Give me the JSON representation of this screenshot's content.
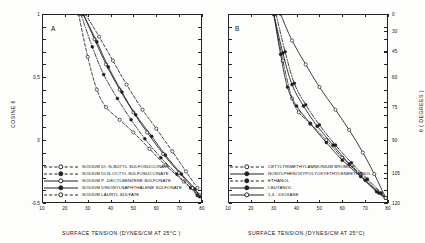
{
  "figure": {
    "panels": [
      {
        "letter": "A",
        "xlabel": "SURFACE TENSION (DYNES/CM AT 25°C )",
        "ylabel": "COSINE  θ",
        "xticks": [
          "10",
          "20",
          "30",
          "40",
          "50",
          "60",
          "70",
          "80"
        ],
        "yticks": [
          "1.0",
          "0.5",
          "0",
          "-0.5"
        ],
        "legend": [
          {
            "label": "SODIUM DI -N-BUTYL SULFOSUCCINATE",
            "style": "dash",
            "marker": "open-circle"
          },
          {
            "label": "SODIUM DI-N-OCTYL SULFOSUCCINATE",
            "style": "dashdot",
            "marker": "filled-circle"
          },
          {
            "label": "SODIUM P -DECYLBENZENE  SULFONATE",
            "style": "solid",
            "marker": "open-circle"
          },
          {
            "label": "SODIUM DINONYLNAPHTHALENE  SULFONATE",
            "style": "solid",
            "marker": "filled-circle"
          },
          {
            "label": "SODIUM LAURYL  SULFATE",
            "style": "dash",
            "marker": "open-circle"
          }
        ]
      },
      {
        "letter": "B",
        "xlabel": "SURFACE TENSION (DYNES/CM AT 25°C)",
        "ylabel": "θ  ( DEGREES )",
        "xticks": [
          "10",
          "20",
          "30",
          "40",
          "50",
          "60",
          "70",
          "80"
        ],
        "yticks": [
          "0",
          "30",
          "45",
          "60",
          "75",
          "90",
          "105",
          "120"
        ],
        "legend": [
          {
            "label": "CETYLTRIMETHYLAMMONIUM BROMIDE",
            "style": "dashdot",
            "marker": "open-circle"
          },
          {
            "label": "NONYLPHENOXYPOLYOXYETHYLENEETHANOL",
            "style": "solid",
            "marker": "filled-circle"
          },
          {
            "label": "ETHANOL",
            "style": "dashdot",
            "marker": "filled-circle"
          },
          {
            "label": "I-BUTANOL",
            "style": "solid",
            "marker": "filled-circle"
          },
          {
            "label": "1,4 - DIOXANE",
            "style": "solid",
            "marker": "open-circle"
          }
        ]
      }
    ]
  },
  "chart_data": {
    "type": "line",
    "title": "",
    "xlabel": "SURFACE TENSION (DYNES/CM AT 25°C)",
    "ylabel_left": "COSINE θ",
    "ylabel_right": "θ (DEGREES)",
    "xlim": [
      10,
      80
    ],
    "ylim_left": [
      -0.5,
      1.0
    ],
    "ylim_right": [
      0,
      120
    ],
    "xticks": [
      10,
      20,
      30,
      40,
      50,
      60,
      70,
      80
    ],
    "yticks_left": [
      1.0,
      0.5,
      0.0,
      -0.5
    ],
    "yticks_right": [
      0,
      30,
      45,
      60,
      75,
      90,
      105,
      120
    ],
    "grid": false,
    "legend_position": "below-axes",
    "panels": [
      {
        "letter": "A",
        "series": [
          {
            "name": "SODIUM DI -N-BUTYL SULFOSUCCINATE",
            "style": "dashed",
            "marker": "open-circle",
            "x": [
              26,
              30,
              34,
              38,
              44,
              50,
              57,
              64,
              72,
              78
            ],
            "y": [
              1.0,
              0.66,
              0.4,
              0.26,
              0.16,
              0.06,
              -0.07,
              -0.2,
              -0.33,
              -0.43
            ]
          },
          {
            "name": "SODIUM DI-N-OCTYL SULFOSUCCINATE",
            "style": "dash-dot",
            "marker": "filled-circle",
            "x": [
              27,
              32,
              37,
              43,
              49,
              55,
              62,
              69,
              75,
              78
            ],
            "y": [
              1.0,
              0.74,
              0.52,
              0.33,
              0.16,
              0.01,
              -0.14,
              -0.27,
              -0.38,
              -0.44
            ]
          },
          {
            "name": "SODIUM P -DECYLBENZENE SULFONATE",
            "style": "solid",
            "marker": "open-circle",
            "x": [
              28,
              33,
              38,
              44,
              50,
              56,
              63,
              70,
              76,
              79
            ],
            "y": [
              1.0,
              0.8,
              0.6,
              0.4,
              0.22,
              0.06,
              -0.11,
              -0.26,
              -0.38,
              -0.44
            ]
          },
          {
            "name": "SODIUM DINONYLNAPHTHALENE SULFONATE",
            "style": "solid",
            "marker": "filled-circle",
            "x": [
              28,
              34,
              39,
              45,
              51,
              58,
              64,
              71,
              77,
              79
            ],
            "y": [
              1.0,
              0.78,
              0.58,
              0.38,
              0.2,
              0.03,
              -0.12,
              -0.27,
              -0.39,
              -0.45
            ]
          },
          {
            "name": "SODIUM LAURYL SULFATE",
            "style": "dashed",
            "marker": "open-circle",
            "x": [
              29,
              35,
              41,
              47,
              54,
              60,
              67,
              73,
              78
            ],
            "y": [
              1.0,
              0.82,
              0.63,
              0.44,
              0.24,
              0.09,
              -0.09,
              -0.25,
              -0.38
            ]
          }
        ]
      },
      {
        "letter": "B",
        "series": [
          {
            "name": "CETYLTRIMETHYLAMMONIUM BROMIDE",
            "style": "dash-dot",
            "marker": "open-circle",
            "x": [
              30,
              34,
              38,
              41,
              46,
              53,
              60,
              68,
              75,
              79
            ],
            "y": [
              1.0,
              0.63,
              0.33,
              0.22,
              0.13,
              0.0,
              -0.14,
              -0.27,
              -0.4,
              -0.46
            ]
          },
          {
            "name": "NONYLPHENOXYPOLYOXYETHYLENEETHANOL",
            "style": "solid",
            "marker": "filled-circle",
            "x": [
              30,
              33,
              36,
              40,
              46,
              53,
              60,
              68,
              75,
              79
            ],
            "y": [
              1.0,
              0.68,
              0.42,
              0.27,
              0.13,
              -0.02,
              -0.16,
              -0.29,
              -0.41,
              -0.46
            ]
          },
          {
            "name": "ETHANOL",
            "style": "dash-dot",
            "marker": "filled-circle",
            "x": [
              31,
              35,
              39,
              44,
              50,
              57,
              64,
              71,
              77,
              79
            ],
            "y": [
              1.0,
              0.7,
              0.45,
              0.28,
              0.12,
              -0.04,
              -0.18,
              -0.31,
              -0.42,
              -0.46
            ]
          },
          {
            "name": "I-BUTANOL",
            "style": "solid",
            "marker": "filled-circle",
            "x": [
              30,
              34,
              38,
              43,
              49,
              56,
              63,
              70,
              76,
              79
            ],
            "y": [
              1.0,
              0.69,
              0.44,
              0.27,
              0.11,
              -0.04,
              -0.19,
              -0.32,
              -0.42,
              -0.46
            ]
          },
          {
            "name": "1,4 - DIOXANE",
            "style": "solid",
            "marker": "open-circle",
            "x": [
              33,
              38,
              44,
              50,
              57,
              63,
              69,
              74,
              79
            ],
            "y": [
              1.0,
              0.79,
              0.6,
              0.42,
              0.24,
              0.08,
              -0.1,
              -0.27,
              -0.46
            ]
          }
        ]
      }
    ]
  }
}
